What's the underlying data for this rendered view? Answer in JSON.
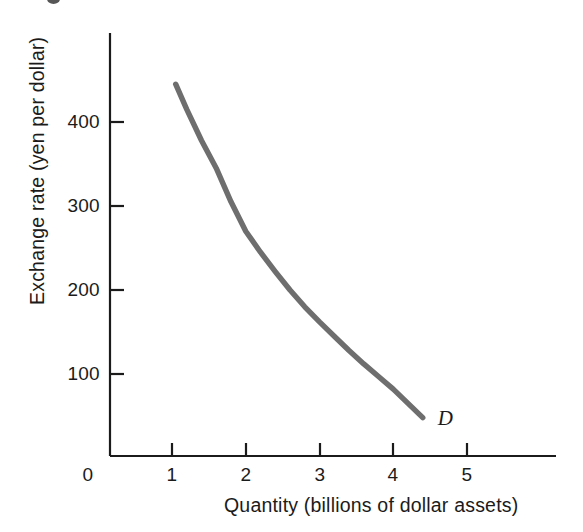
{
  "figure": {
    "background_color": "#ffffff",
    "curve_color": "#6e6e6e",
    "axis_color": "#1b1b1b",
    "text_color": "#1b1b1b"
  },
  "axes": {
    "y_title": "Exchange rate (yen per dollar)",
    "x_title": "Quantity (billions of dollar assets)",
    "origin_label": "0",
    "y_ticks": [
      "100",
      "200",
      "300",
      "400"
    ],
    "x_ticks": [
      "1",
      "2",
      "3",
      "4",
      "5"
    ]
  },
  "curve": {
    "label": "D"
  },
  "chart_data": {
    "type": "line",
    "title": "",
    "subtitle": "",
    "xlabel": "Quantity (billions of dollar assets)",
    "ylabel": "Exchange rate (yen per dollar)",
    "xlim": [
      0,
      6
    ],
    "ylim": [
      0,
      500
    ],
    "xticks": [
      1,
      2,
      3,
      4,
      5
    ],
    "yticks": [
      100,
      200,
      300,
      400
    ],
    "grid": false,
    "legend": null,
    "annotations": [
      {
        "text": "D",
        "x": 4.55,
        "y": 48,
        "style": "italic",
        "meaning": "demand-curve-label"
      }
    ],
    "series": [
      {
        "name": "D",
        "color": "#6e6e6e",
        "x": [
          1.05,
          1.2,
          1.4,
          1.6,
          1.8,
          2.0,
          2.2,
          2.4,
          2.6,
          2.8,
          3.0,
          3.2,
          3.4,
          3.6,
          3.8,
          4.0,
          4.2,
          4.4
        ],
        "y": [
          445,
          415,
          378,
          345,
          305,
          270,
          245,
          222,
          200,
          180,
          162,
          145,
          128,
          112,
          97,
          82,
          65,
          48
        ]
      }
    ]
  }
}
